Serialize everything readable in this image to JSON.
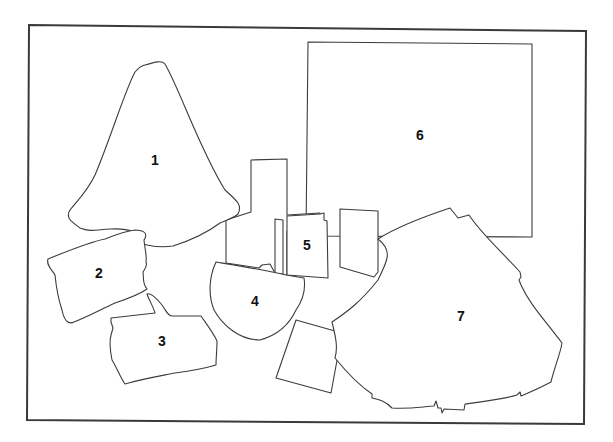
{
  "diagram": {
    "type": "numbered-shape-map",
    "width": 613,
    "height": 442,
    "colors": {
      "background": "#ffffff",
      "stroke": "#3c3c3c",
      "frame": "#3a3a3a",
      "label": "#111111"
    },
    "frame": "M29,25 L586,31 L584,424 L27,420 Z",
    "unlabeled_pieces": [
      {
        "id": "tall-block",
        "path": "M226,220 L251,212 L251,160 L287,159 L287,215 L320,213 L320,232 L306,232 L306,230 L287,231 L287,275 L277,277 L270,264 L262,265 L259,268 L226,263 Z"
      },
      {
        "id": "narrow-strip",
        "path": "M275,219 L283,220 L283,274 L275,274 Z"
      },
      {
        "id": "right-small-rect",
        "path": "M340,209 L378,211 L378,272 L374,277 L340,267 Z"
      },
      {
        "id": "tilted-square",
        "path": "M296,320 L342,333 L331,393 L276,378 Z"
      }
    ],
    "pieces": [
      {
        "id": "1",
        "label": "1",
        "label_x": 155,
        "label_y": 160,
        "path": "M145,65 C155,62 162,60 165,64 C180,90 200,150 225,190 C236,200 243,205 238,214 C232,219 226,220 220,223 C208,232 192,240 173,246 C160,248 150,246 142,244 C140,232 130,228 110,229 C95,230 90,232 80,228 C72,222 65,218 70,210 C80,198 88,190 95,175 C110,140 125,90 135,72 C140,66 142,66 145,65 Z"
      },
      {
        "id": "2",
        "label": "2",
        "label_x": 99,
        "label_y": 273,
        "path": "M48,259 C70,250 90,242 105,239 C115,235 125,231 135,230 C145,230 148,234 144,240 C145,250 147,256 146,262 C148,266 144,270 143,272 C144,278 142,283 147,289 C140,294 130,298 115,303 C100,310 85,318 74,322 C68,325 64,320 62,310 C58,298 56,285 55,275 C52,270 46,265 48,259 Z"
      },
      {
        "id": "3",
        "label": "3",
        "label_x": 162,
        "label_y": 341,
        "path": "M111,318 L155,313 C153,306 149,300 147,294 C151,292 158,300 162,305 C167,312 168,316 172,316 L201,316 C205,322 213,332 217,341 C217,350 216,358 216,365 C206,368 190,371 175,373 C160,376 142,379 125,384 C120,377 117,368 112,360 C110,350 109,342 111,335 L113,328 L111,322 Z"
      },
      {
        "id": "4",
        "label": "4",
        "label_x": 255,
        "label_y": 301,
        "path": "M216,262 C240,266 265,270 286,275 L304,278 C306,290 303,300 296,310 C290,323 278,335 260,340 C240,340 223,326 214,310 C208,295 209,277 216,262 Z"
      },
      {
        "id": "5",
        "label": "5",
        "label_x": 307,
        "label_y": 245,
        "path": "M287,216 L320,214 L324,213 L324,220 L327,221 L328,278 L287,275 Z"
      },
      {
        "id": "6",
        "label": "6",
        "label_x": 420,
        "label_y": 135,
        "path": "M308,42 L532,44 L532,237 L306,236 Z"
      },
      {
        "id": "7",
        "label": "7",
        "label_x": 461,
        "label_y": 316,
        "path": "M378,239 C395,228 420,218 450,208 L458,218 L469,215 C480,232 495,245 520,272 L521,277 L519,280 L521,285 C530,305 545,320 562,343 C560,355 555,365 551,382 C540,388 528,393 521,396 L520,392 L517,395 C505,399 480,402 465,404 L464,410 L444,409 L442,413 L441,408 L438,408 L436,401 L434,406 C420,407 410,409 392,408 C385,401 380,400 372,398 L372,394 C360,386 348,374 335,358 C338,348 336,338 332,322 C350,310 362,300 378,280 C385,264 395,252 378,239 Z"
      }
    ]
  }
}
